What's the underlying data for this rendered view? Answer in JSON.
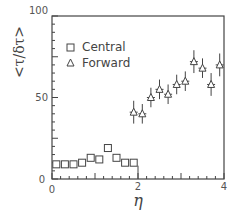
{
  "chart_data": {
    "type": "scatter",
    "title": "",
    "xlabel": "η",
    "ylabel": "<τ/δτ>",
    "xlim": [
      0,
      4
    ],
    "ylim": [
      0,
      100
    ],
    "x_ticks": [
      "0",
      "2",
      "4"
    ],
    "y_ticks": [
      "0",
      "50",
      "100"
    ],
    "grid": false,
    "legend_position": "upper-left",
    "legend": [
      "Central",
      "Forward"
    ],
    "series": [
      {
        "name": "Central",
        "marker": "square",
        "x": [
          0.1,
          0.3,
          0.5,
          0.7,
          0.9,
          1.1,
          1.3,
          1.5,
          1.7,
          1.9
        ],
        "values": [
          9,
          9,
          9,
          10,
          13,
          12,
          19,
          13,
          10,
          10
        ],
        "errors": [
          0,
          0,
          0,
          0,
          0,
          0,
          0,
          0,
          0,
          0
        ]
      },
      {
        "name": "Forward",
        "marker": "triangle",
        "x": [
          1.9,
          2.1,
          2.3,
          2.5,
          2.7,
          2.9,
          3.1,
          3.3,
          3.5,
          3.7,
          3.9
        ],
        "values": [
          41,
          40,
          50,
          55,
          52,
          58,
          60,
          72,
          68,
          58,
          70
        ],
        "errors": [
          7,
          6,
          6,
          6,
          6,
          6,
          6,
          7,
          6,
          7,
          7
        ]
      }
    ],
    "annotations": [
      "vertical line at η=2 from axis to central point"
    ]
  },
  "labels": {
    "legend_central": "Central",
    "legend_forward": "Forward",
    "ylabel": "<τ/δτ>",
    "xlabel": "η",
    "ytick_0": "0",
    "ytick_50": "50",
    "ytick_100": "100",
    "xtick_0": "0",
    "xtick_2": "2",
    "xtick_4": "4"
  }
}
